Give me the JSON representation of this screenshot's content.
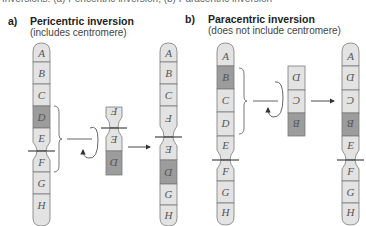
{
  "caption": "Inversions: (a) Pericentric inversion; (b) Paracentric inversion",
  "colors": {
    "light": "#e3e3e3",
    "dark": "#9c9c9c",
    "outline": "#7a7a7a",
    "line": "#333333"
  },
  "panel_a": {
    "label": "a)",
    "title": "Pericentric inversion",
    "subtitle": "(includes centromere)",
    "original": [
      "A",
      "B",
      "C",
      "D",
      "E",
      "F",
      "G",
      "H"
    ],
    "inverted_fragment": [
      "F",
      "E",
      "D"
    ],
    "result": [
      "A",
      "B",
      "C",
      "F",
      "E",
      "D",
      "G",
      "H"
    ]
  },
  "panel_b": {
    "label": "b)",
    "title": "Paracentric inversion",
    "subtitle": "(does not include centromere)",
    "original": [
      "A",
      "B",
      "C",
      "D",
      "E",
      "F",
      "G",
      "H"
    ],
    "inverted_fragment": [
      "D",
      "C",
      "B"
    ],
    "result": [
      "A",
      "D",
      "C",
      "B",
      "E",
      "F",
      "G",
      "H"
    ]
  }
}
